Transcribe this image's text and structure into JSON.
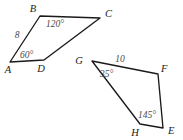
{
  "figure": {
    "background_color": "#ffffff",
    "stroke_color": "#1a1a1a",
    "label_color": "#1a1a1a",
    "measure_color": "#4a4a4a"
  },
  "shapes": [
    {
      "name": "quadrilateral-abcd",
      "vertices": [
        {
          "id": "A",
          "label": "A",
          "x": 10,
          "y": 62,
          "label_x": 8,
          "label_y": 73
        },
        {
          "id": "B",
          "label": "B",
          "x": 40,
          "y": 16,
          "label_x": 33,
          "label_y": 12
        },
        {
          "id": "C",
          "label": "C",
          "x": 100,
          "y": 18,
          "label_x": 105,
          "label_y": 17
        },
        {
          "id": "D",
          "label": "D",
          "x": 44,
          "y": 60,
          "label_x": 41,
          "label_y": 72
        }
      ],
      "path": "A-B-C-D-A",
      "angle_labels": [
        {
          "name": "angle-at-b",
          "text": "120°",
          "vertex": "B",
          "x": 46,
          "y": 27
        },
        {
          "name": "angle-at-a",
          "text": "60°",
          "vertex": "A",
          "x": 20,
          "y": 58
        }
      ],
      "side_labels": [
        {
          "name": "side-ab-length",
          "text": "8",
          "side": "A-B",
          "x": 17,
          "y": 38
        }
      ]
    },
    {
      "name": "quadrilateral-gfeh",
      "vertices": [
        {
          "id": "G",
          "label": "G",
          "x": 92,
          "y": 61,
          "label_x": 79,
          "label_y": 64
        },
        {
          "id": "F",
          "label": "F",
          "x": 158,
          "y": 74,
          "label_x": 161,
          "label_y": 72
        },
        {
          "id": "E",
          "label": "E",
          "x": 163,
          "y": 128,
          "label_x": 168,
          "label_y": 134
        },
        {
          "id": "H",
          "label": "H",
          "x": 140,
          "y": 124,
          "label_x": 135,
          "label_y": 136
        }
      ],
      "path": "G-F-E-H-G",
      "angle_labels": [
        {
          "name": "angle-at-g",
          "text": "35°",
          "vertex": "G",
          "x": 100,
          "y": 77
        },
        {
          "name": "angle-at-h",
          "text": "145°",
          "vertex": "H",
          "x": 138,
          "y": 118
        }
      ],
      "side_labels": [
        {
          "name": "side-gf-length",
          "text": "10",
          "side": "G-F",
          "x": 120,
          "y": 62
        }
      ]
    }
  ]
}
